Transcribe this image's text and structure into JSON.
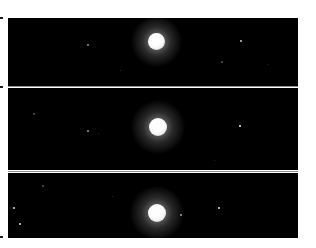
{
  "figure": {
    "title": "Three-epoch imaging sequence of a bright planetary disc with faint satellites",
    "background_color": "#ffffff",
    "panel_color": "#000000",
    "divider_color": "#8e8e8e",
    "object_color": "#ffffff",
    "width": 316,
    "height": 248,
    "panel_count": 3
  },
  "panels": [
    {
      "label": "panel-1",
      "frame": {
        "x": 8,
        "y": 18,
        "width": 290,
        "height": 68
      },
      "primary": {
        "name": "planet-disc",
        "cx": 156,
        "cy": 41,
        "r": 8.5,
        "brightness": "saturated"
      },
      "satellites": [
        {
          "name": "moon-left-1",
          "cx": 88,
          "cy": 45,
          "r": 0.9,
          "brightness": "faint"
        },
        {
          "name": "moon-right-1",
          "cx": 241,
          "cy": 41,
          "r": 1.1,
          "brightness": "faint"
        }
      ],
      "specks": [
        {
          "cx": 222,
          "cy": 62,
          "r": 0.6
        },
        {
          "cx": 268,
          "cy": 64,
          "r": 0.5
        },
        {
          "cx": 120,
          "cy": 70,
          "r": 0.5
        }
      ]
    },
    {
      "label": "panel-2",
      "frame": {
        "x": 8,
        "y": 88,
        "width": 290,
        "height": 82
      },
      "primary": {
        "name": "planet-disc",
        "cx": 158,
        "cy": 127,
        "r": 9.0,
        "brightness": "saturated"
      },
      "satellites": [
        {
          "name": "moon-left-1",
          "cx": 88,
          "cy": 131,
          "r": 1.0,
          "brightness": "faint"
        },
        {
          "name": "moon-right-1",
          "cx": 240,
          "cy": 126,
          "r": 1.2,
          "brightness": "moderate"
        }
      ],
      "specks": [
        {
          "cx": 34,
          "cy": 114,
          "r": 0.7
        },
        {
          "cx": 98,
          "cy": 133,
          "r": 0.5
        },
        {
          "cx": 214,
          "cy": 160,
          "r": 0.5
        }
      ]
    },
    {
      "label": "panel-3",
      "frame": {
        "x": 8,
        "y": 173,
        "width": 290,
        "height": 65
      },
      "primary": {
        "name": "planet-disc",
        "cx": 157,
        "cy": 213,
        "r": 9.0,
        "brightness": "saturated"
      },
      "satellites": [
        {
          "name": "moon-far-left-1",
          "cx": 14,
          "cy": 208,
          "r": 1.1,
          "brightness": "moderate"
        },
        {
          "name": "moon-far-left-2",
          "cx": 20,
          "cy": 224,
          "r": 1.1,
          "brightness": "moderate"
        },
        {
          "name": "moon-near-right-1",
          "cx": 181,
          "cy": 215,
          "r": 1.0,
          "brightness": "faint"
        },
        {
          "name": "moon-right-1",
          "cx": 219,
          "cy": 208,
          "r": 1.1,
          "brightness": "moderate"
        }
      ],
      "specks": [
        {
          "cx": 43,
          "cy": 186,
          "r": 0.6
        },
        {
          "cx": 112,
          "cy": 196,
          "r": 0.5
        }
      ]
    }
  ],
  "dividers": [
    {
      "name": "divider-1-2",
      "x": 8,
      "y": 86,
      "width": 290
    },
    {
      "name": "divider-2-3",
      "x": 8,
      "y": 171,
      "width": 290
    }
  ],
  "edge_notches": [
    {
      "name": "notch-top-left",
      "x": 0,
      "y": 17
    },
    {
      "name": "notch-mid-left",
      "x": 0,
      "y": 86
    },
    {
      "name": "notch-bottom-left",
      "x": 0,
      "y": 236
    }
  ]
}
